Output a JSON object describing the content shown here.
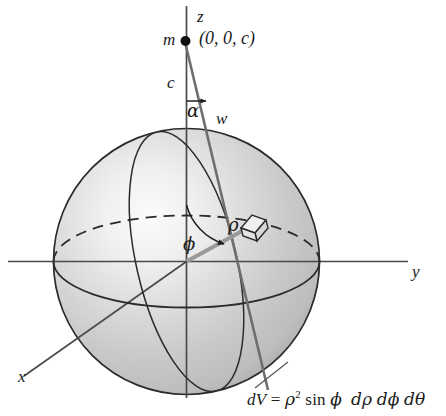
{
  "figure": {
    "background_color": "#ffffff",
    "line_color": "#262626",
    "sphere_shade_light": "#f2f2f2",
    "sphere_shade_mid": "#cfcfcf",
    "sphere_shade_dark": "#9a9a9a"
  },
  "axes": {
    "z_label": "z",
    "x_label": "x",
    "y_label": "y"
  },
  "point": {
    "mass_label": "m",
    "coords_label": "(0, 0, c)",
    "height_label": "c"
  },
  "angles": {
    "alpha_label": "α",
    "phi_label": "ϕ"
  },
  "segments": {
    "w_label": "w",
    "rho_label": "ρ"
  },
  "volume_element": {
    "name": "dV",
    "formula_plain": "dV = ρ2 sin ϕ dρ dϕ dθ",
    "formula_parts": {
      "lhs": "dV",
      "equals": "=",
      "rho": "ρ",
      "exponent": "2",
      "sin": "sin",
      "phi": "ϕ",
      "d_rho": "dρ",
      "d_phi": "dϕ",
      "d_theta": "dθ"
    }
  }
}
